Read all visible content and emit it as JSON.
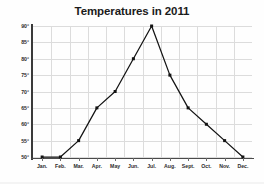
{
  "chart_data": {
    "type": "line",
    "title": "Temperatures in 2011",
    "xlabel": "",
    "ylabel": "",
    "categories": [
      "Jan.",
      "Feb.",
      "Mar.",
      "Apr.",
      "May",
      "Jun.",
      "Jul.",
      "Aug.",
      "Sept.",
      "Oct.",
      "Nov.",
      "Dec."
    ],
    "values": [
      50,
      50,
      55,
      65,
      70,
      80,
      90,
      75,
      65,
      60,
      55,
      50
    ],
    "y_tick_labels": [
      "90°",
      "85°",
      "80°",
      "75°",
      "70°",
      "65°",
      "60°",
      "55°",
      "50°"
    ],
    "y_tick_values": [
      90,
      85,
      80,
      75,
      70,
      65,
      60,
      55,
      50
    ],
    "ylim": [
      50,
      90
    ],
    "grid": true,
    "legend": "none",
    "series_color": "#131313",
    "grid_color": "#dcdcdc",
    "axis_color": "#3a3a3a",
    "marker": "square"
  }
}
